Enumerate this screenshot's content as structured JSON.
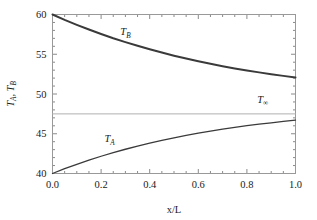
{
  "chart_data": {
    "type": "line",
    "title": "",
    "xlabel": "x/L",
    "ylabel": "T_A, T_B",
    "xlim": [
      0.0,
      1.0
    ],
    "ylim": [
      40,
      60
    ],
    "grid": false,
    "frame": true,
    "ticks_all_sides": true,
    "xticks": [
      "0.0",
      "0.2",
      "0.4",
      "0.6",
      "0.8",
      "1.0"
    ],
    "xtick_values": [
      0.0,
      0.2,
      0.4,
      0.6,
      0.8,
      1.0
    ],
    "yticks": [
      "40",
      "45",
      "50",
      "55",
      "60"
    ],
    "ytick_values": [
      40,
      45,
      50,
      55,
      60
    ],
    "x_minor_step": 0.05,
    "y_minor_step": 1,
    "legend": "inline-annotations",
    "series": [
      {
        "name": "T_B",
        "label": "T_B",
        "color": "#3a3a3a",
        "width": 2.0,
        "annotation_x": 0.3,
        "annotation_y": 57.4,
        "x": [
          0.0,
          0.05,
          0.1,
          0.15,
          0.2,
          0.25,
          0.3,
          0.35,
          0.4,
          0.45,
          0.5,
          0.55,
          0.6,
          0.65,
          0.7,
          0.75,
          0.8,
          0.85,
          0.9,
          0.95,
          1.0
        ],
        "values": [
          60.0,
          59.33,
          58.7,
          58.11,
          57.55,
          57.02,
          56.53,
          56.06,
          55.62,
          55.21,
          54.82,
          54.46,
          54.12,
          53.8,
          53.5,
          53.22,
          52.96,
          52.72,
          52.49,
          52.28,
          52.08
        ]
      },
      {
        "name": "T_A",
        "label": "T_A",
        "color": "#3a3a3a",
        "width": 1.3,
        "annotation_x": 0.235,
        "annotation_y": 43.9,
        "x": [
          0.0,
          0.05,
          0.1,
          0.15,
          0.2,
          0.25,
          0.3,
          0.35,
          0.4,
          0.45,
          0.5,
          0.55,
          0.6,
          0.65,
          0.7,
          0.75,
          0.8,
          0.85,
          0.9,
          0.95,
          1.0
        ],
        "values": [
          40.0,
          40.6,
          41.16,
          41.68,
          42.17,
          42.63,
          43.05,
          43.45,
          43.82,
          44.17,
          44.49,
          44.79,
          45.07,
          45.33,
          45.57,
          45.8,
          46.01,
          46.2,
          46.38,
          46.55,
          46.71
        ]
      },
      {
        "name": "T_inf",
        "label": "T_∞",
        "color": "#b0b0b0",
        "width": 1.0,
        "constant": 47.5,
        "annotation_x": 0.865,
        "annotation_y": 48.9
      }
    ]
  },
  "axes": {
    "x_title": "x/L",
    "y_title_parts": {
      "first": "T",
      "first_sub": "A",
      "second": "T",
      "second_sub": "B"
    }
  },
  "labels": {
    "tb": {
      "base": "T",
      "sub": "B"
    },
    "ta": {
      "base": "T",
      "sub": "A"
    },
    "tinf": {
      "base": "T",
      "sub": "∞"
    }
  },
  "colors": {
    "background": "#ffffff",
    "frame": "#999999",
    "tick": "#8a8a8a",
    "curve_b": "#3a3a3a",
    "curve_a": "#3a3a3a",
    "curve_inf": "#b0b0b0",
    "text": "#1a1a1a"
  }
}
